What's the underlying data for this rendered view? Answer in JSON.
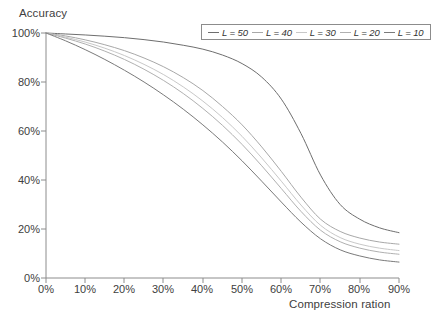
{
  "chart_data": {
    "type": "line",
    "title": "",
    "ylabel": "Accuracy",
    "xlabel": "Compression ration",
    "xlim": [
      0,
      90
    ],
    "ylim": [
      0,
      100
    ],
    "grid": false,
    "legend_position": "top-right",
    "xticks": [
      "0%",
      "10%",
      "20%",
      "30%",
      "40%",
      "50%",
      "60%",
      "70%",
      "80%",
      "90%"
    ],
    "yticks": [
      "0%",
      "20%",
      "40%",
      "60%",
      "80%",
      "100%"
    ],
    "x": [
      0,
      5,
      10,
      15,
      20,
      25,
      30,
      35,
      40,
      45,
      50,
      55,
      60,
      65,
      70,
      75,
      80,
      85,
      90
    ],
    "series": [
      {
        "name": "L = 50",
        "color": "#6e6e6e",
        "values": [
          100,
          99.6,
          99.2,
          98.7,
          98.1,
          97.3,
          96.3,
          95.0,
          93.4,
          91.0,
          87.5,
          82.0,
          73.0,
          59.0,
          42.0,
          30.0,
          24.0,
          20.5,
          18.5
        ]
      },
      {
        "name": "L = 40",
        "color": "#a8a8a8",
        "values": [
          100,
          98.8,
          97.2,
          95.2,
          92.8,
          89.8,
          86.2,
          81.8,
          76.5,
          70.0,
          62.5,
          53.5,
          43.5,
          33.0,
          24.0,
          19.0,
          16.3,
          14.7,
          13.8
        ]
      },
      {
        "name": "L = 30",
        "color": "#c8c8c8",
        "values": [
          100,
          98.3,
          96.3,
          93.8,
          90.8,
          87.2,
          83.0,
          78.0,
          72.2,
          65.5,
          57.8,
          49.0,
          39.5,
          29.8,
          21.5,
          16.5,
          13.8,
          12.2,
          11.2
        ]
      },
      {
        "name": "L = 20",
        "color": "#b0b0b0",
        "values": [
          100,
          97.9,
          95.5,
          92.6,
          89.2,
          85.2,
          80.6,
          75.3,
          69.2,
          62.3,
          54.5,
          45.8,
          36.5,
          27.2,
          19.5,
          14.8,
          12.2,
          10.6,
          9.7
        ]
      },
      {
        "name": "L = 10",
        "color": "#7a7a7a",
        "values": [
          100,
          96.8,
          93.2,
          89.2,
          84.8,
          80.0,
          74.7,
          68.9,
          62.5,
          55.5,
          47.8,
          39.5,
          31.0,
          22.8,
          16.0,
          11.5,
          9.0,
          7.4,
          6.5
        ]
      }
    ]
  },
  "axes": {
    "frame_color": "#8c8c8c",
    "tick_color": "#8c8c8c"
  }
}
